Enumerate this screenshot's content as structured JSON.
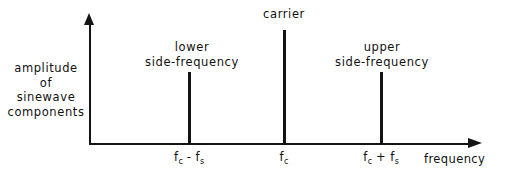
{
  "chart_data": {
    "type": "bar",
    "title": "",
    "xlabel": "frequency",
    "ylabel": "amplitude of sinewave components",
    "grid": false,
    "legend": false,
    "x_tick_labels": [
      "f_c - f_s",
      "f_c",
      "f_c + f_s"
    ],
    "categories": [
      "lower side-frequency",
      "carrier",
      "upper side-frequency"
    ],
    "values": [
      0.63,
      1.0,
      0.63
    ],
    "annotations": [
      "lower side-frequency",
      "carrier",
      "upper side-frequency"
    ],
    "axis_arrows": [
      "up",
      "right"
    ]
  },
  "figure": {
    "y_axis_label_lines": [
      "amplitude",
      "of",
      "sinewave",
      "components"
    ],
    "x_axis_label": "frequency",
    "annotations": {
      "carrier": "carrier",
      "lower_line1": "lower",
      "lower_line2": "side-frequency",
      "upper_line1": "upper",
      "upper_line2": "side-frequency"
    },
    "ticks": {
      "lower_base": "f",
      "lower_sub1": "c",
      "lower_op": " - f",
      "lower_sub2": "s",
      "carrier_base": "f",
      "carrier_sub": "c",
      "upper_base": "f",
      "upper_sub1": "c",
      "upper_op": " + f",
      "upper_sub2": "s"
    },
    "colors": {
      "ink": "#141414",
      "background": "#ffffff"
    }
  }
}
